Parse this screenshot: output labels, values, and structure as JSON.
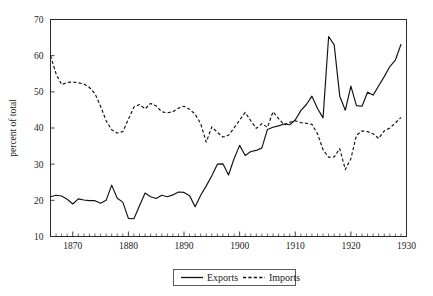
{
  "chart_data": {
    "type": "line",
    "title": "",
    "xlabel": "",
    "ylabel": "percent of total",
    "xlim": [
      1866,
      1930
    ],
    "ylim": [
      10,
      70
    ],
    "grid": false,
    "legend_position": "bottom-center",
    "y_ticks": [
      10,
      20,
      30,
      40,
      50,
      60,
      70
    ],
    "x_ticks": [
      1870,
      1880,
      1890,
      1900,
      1910,
      1920,
      1930
    ],
    "x_tick_labels": [
      "1870",
      "1880",
      "1890",
      "1900",
      "1910",
      "1920",
      "1930"
    ],
    "y_tick_labels": [
      "10",
      "20",
      "30",
      "40",
      "50",
      "60",
      "70"
    ],
    "x_minor_tick_interval": 1,
    "x": [
      1866,
      1867,
      1868,
      1869,
      1870,
      1871,
      1872,
      1873,
      1874,
      1875,
      1876,
      1877,
      1878,
      1879,
      1880,
      1881,
      1882,
      1883,
      1884,
      1885,
      1886,
      1887,
      1888,
      1889,
      1890,
      1891,
      1892,
      1893,
      1894,
      1895,
      1896,
      1897,
      1898,
      1899,
      1900,
      1901,
      1902,
      1903,
      1904,
      1905,
      1906,
      1907,
      1908,
      1909,
      1910,
      1911,
      1912,
      1913,
      1914,
      1915,
      1916,
      1917,
      1918,
      1919,
      1920,
      1921,
      1922,
      1923,
      1924,
      1925,
      1926,
      1927,
      1928,
      1929
    ],
    "series": [
      {
        "name": "Exports",
        "style": "solid",
        "values": [
          21.0,
          21.4,
          21.2,
          20.3,
          19.0,
          20.4,
          20.1,
          19.9,
          19.9,
          19.2,
          20.0,
          24.2,
          20.6,
          19.5,
          15.0,
          14.9,
          18.5,
          22.0,
          21.0,
          20.5,
          21.4,
          21.0,
          21.5,
          22.3,
          22.2,
          21.3,
          18.2,
          21.4,
          24.0,
          26.8,
          30.0,
          30.1,
          27.0,
          31.5,
          35.2,
          32.4,
          33.5,
          33.8,
          34.5,
          39.6,
          40.2,
          40.6,
          41.1,
          40.9,
          42.2,
          44.8,
          46.5,
          48.8,
          45.4,
          42.8,
          65.3,
          63.0,
          48.8,
          44.9,
          51.6,
          46.2,
          46.0,
          49.9,
          49.1,
          51.7,
          54.2,
          57.0,
          58.8,
          63.1
        ]
      },
      {
        "name": "Imports",
        "style": "dashed",
        "values": [
          60.0,
          55.0,
          52.0,
          52.6,
          52.7,
          52.5,
          52.2,
          51.2,
          49.5,
          46.0,
          42.0,
          39.5,
          38.6,
          39.0,
          42.4,
          45.8,
          46.5,
          45.3,
          46.8,
          46.1,
          44.5,
          44.2,
          44.5,
          45.5,
          46.0,
          45.2,
          43.8,
          41.2,
          36.1,
          40.3,
          38.8,
          37.5,
          38.0,
          40.0,
          42.2,
          44.3,
          42.0,
          39.9,
          41.2,
          40.2,
          44.5,
          42.6,
          40.9,
          41.6,
          42.0,
          41.5,
          41.3,
          41.0,
          38.4,
          34.0,
          31.9,
          32.0,
          34.3,
          28.5,
          31.5,
          38.0,
          39.2,
          39.0,
          38.4,
          37.1,
          39.2,
          40.0,
          41.4,
          42.9
        ]
      }
    ]
  },
  "legend": {
    "items": [
      {
        "label": "Exports",
        "style": "solid"
      },
      {
        "label": "Imports",
        "style": "dashed"
      }
    ]
  }
}
